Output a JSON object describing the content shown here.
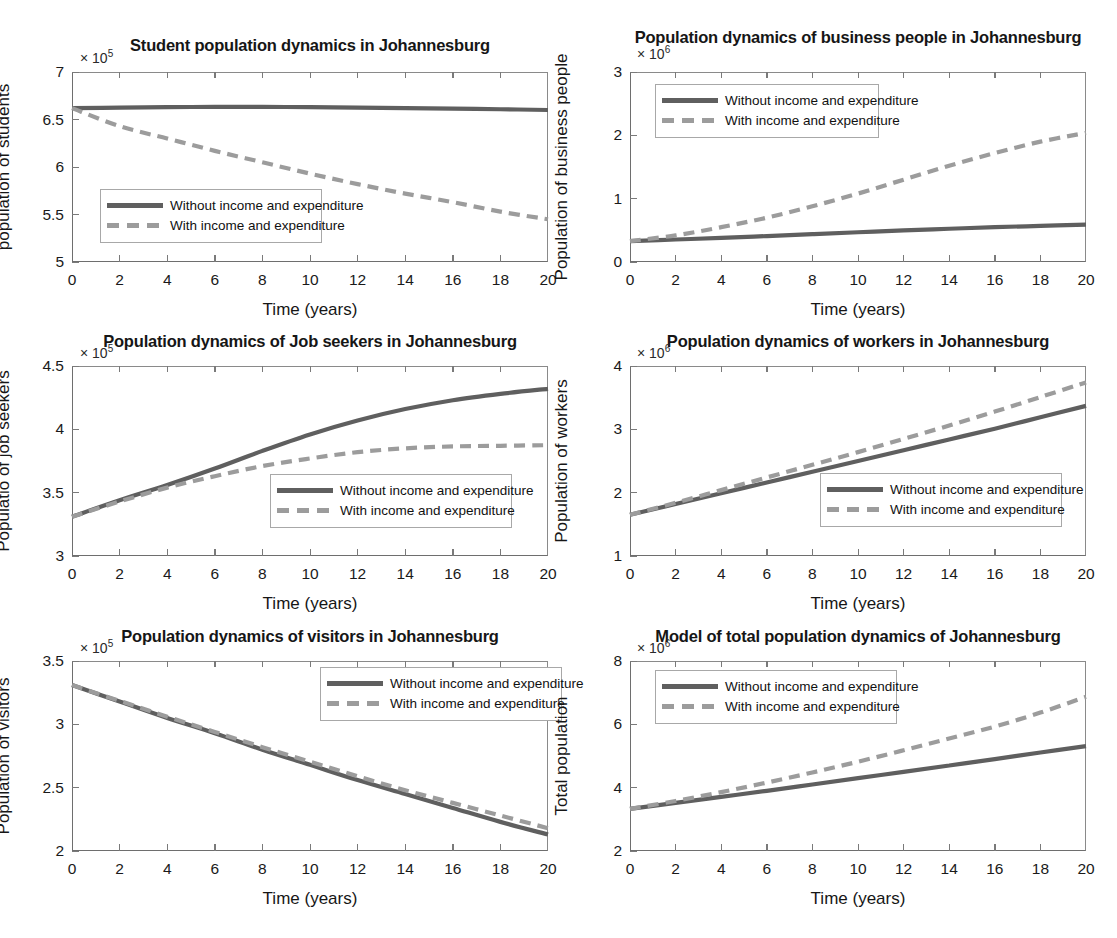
{
  "figure": {
    "layout": "3 rows x 2 columns of MATLAB line plots",
    "background": "#ffffff",
    "series_colors": {
      "without": "#5f5f5f",
      "with": "#9c9c9c"
    }
  },
  "legend_labels": {
    "without": "Without income and expenditure",
    "with": "With income and expenditure"
  },
  "xlabel": "Time (years)",
  "xticks": [
    "0",
    "2",
    "4",
    "6",
    "8",
    "10",
    "12",
    "14",
    "16",
    "18",
    "20"
  ],
  "chart_data": [
    {
      "id": "students",
      "type": "line",
      "title": "Student population dynamics in Johannesburg",
      "xlabel": "Time (years)",
      "ylabel": "population of students",
      "exponent_prefix": "× 10",
      "exponent": "5",
      "xlim": [
        0,
        20
      ],
      "ylim": [
        5,
        7
      ],
      "yticks": [
        "5",
        "5.5",
        "6",
        "6.5",
        "7"
      ],
      "xticks": [
        "0",
        "2",
        "4",
        "6",
        "8",
        "10",
        "12",
        "14",
        "16",
        "18",
        "20"
      ],
      "grid": false,
      "legend_position": "lower-left",
      "x": [
        0,
        2,
        4,
        6,
        8,
        10,
        12,
        14,
        16,
        18,
        20
      ],
      "series": [
        {
          "name": "Without income and expenditure",
          "style": "solid",
          "values": [
            6.62,
            6.625,
            6.63,
            6.632,
            6.632,
            6.63,
            6.625,
            6.62,
            6.615,
            6.608,
            6.6
          ]
        },
        {
          "name": "With income and expenditure",
          "style": "dashed",
          "values": [
            6.62,
            6.43,
            6.3,
            6.17,
            6.05,
            5.93,
            5.82,
            5.72,
            5.63,
            5.53,
            5.45
          ]
        }
      ]
    },
    {
      "id": "business-people",
      "type": "line",
      "title": "Population dynamics of business people in Johannesburg",
      "xlabel": "Time (years)",
      "ylabel": "Population of business people",
      "exponent_prefix": "× 10",
      "exponent": "6",
      "xlim": [
        0,
        20
      ],
      "ylim": [
        0,
        3
      ],
      "yticks": [
        "0",
        "1",
        "2",
        "3"
      ],
      "xticks": [
        "0",
        "2",
        "4",
        "6",
        "8",
        "10",
        "12",
        "14",
        "16",
        "18",
        "20"
      ],
      "grid": false,
      "legend_position": "upper-left",
      "x": [
        0,
        2,
        4,
        6,
        8,
        10,
        12,
        14,
        16,
        18,
        20
      ],
      "series": [
        {
          "name": "Without income and expenditure",
          "style": "solid",
          "values": [
            0.33,
            0.355,
            0.38,
            0.41,
            0.44,
            0.47,
            0.5,
            0.525,
            0.55,
            0.57,
            0.59
          ]
        },
        {
          "name": "With income and expenditure",
          "style": "dashed",
          "values": [
            0.33,
            0.42,
            0.55,
            0.7,
            0.88,
            1.08,
            1.3,
            1.52,
            1.72,
            1.9,
            2.04
          ]
        }
      ]
    },
    {
      "id": "job-seekers",
      "type": "line",
      "title": "Population dynamics of Job seekers in Johannesburg",
      "xlabel": "Time (years)",
      "ylabel": "Populatio of job seekers",
      "exponent_prefix": "× 10",
      "exponent": "5",
      "xlim": [
        0,
        20
      ],
      "ylim": [
        3,
        4.5
      ],
      "yticks": [
        "3",
        "3.5",
        "4",
        "4.5"
      ],
      "xticks": [
        "0",
        "2",
        "4",
        "6",
        "8",
        "10",
        "12",
        "14",
        "16",
        "18",
        "20"
      ],
      "grid": false,
      "legend_position": "lower-right",
      "x": [
        0,
        2,
        4,
        6,
        8,
        10,
        12,
        14,
        16,
        18,
        20
      ],
      "series": [
        {
          "name": "Without income and expenditure",
          "style": "solid",
          "values": [
            3.31,
            3.44,
            3.56,
            3.69,
            3.83,
            3.96,
            4.07,
            4.16,
            4.23,
            4.28,
            4.32
          ]
        },
        {
          "name": "With income and expenditure",
          "style": "dashed",
          "values": [
            3.31,
            3.43,
            3.54,
            3.63,
            3.71,
            3.77,
            3.82,
            3.85,
            3.865,
            3.87,
            3.875
          ]
        }
      ]
    },
    {
      "id": "workers",
      "type": "line",
      "title": "Population dynamics of workers in Johannesburg",
      "xlabel": "Time (years)",
      "ylabel": "Population of workers",
      "exponent_prefix": "× 10",
      "exponent": "6",
      "xlim": [
        0,
        20
      ],
      "ylim": [
        1,
        4
      ],
      "yticks": [
        "1",
        "2",
        "3",
        "4"
      ],
      "xticks": [
        "0",
        "2",
        "4",
        "6",
        "8",
        "10",
        "12",
        "14",
        "16",
        "18",
        "20"
      ],
      "grid": false,
      "legend_position": "lower-right",
      "x": [
        0,
        2,
        4,
        6,
        8,
        10,
        12,
        14,
        16,
        18,
        20
      ],
      "series": [
        {
          "name": "Without income and expenditure",
          "style": "solid",
          "values": [
            1.65,
            1.82,
            1.99,
            2.16,
            2.33,
            2.5,
            2.67,
            2.84,
            3.01,
            3.19,
            3.37
          ]
        },
        {
          "name": "With income and expenditure",
          "style": "dashed",
          "values": [
            1.65,
            1.84,
            2.04,
            2.24,
            2.44,
            2.64,
            2.85,
            3.06,
            3.28,
            3.51,
            3.74
          ]
        }
      ]
    },
    {
      "id": "visitors",
      "type": "line",
      "title": "Population dynamics of visitors in Johannesburg",
      "xlabel": "Time (years)",
      "ylabel": "Population of visitors",
      "exponent_prefix": "× 10",
      "exponent": "5",
      "xlim": [
        0,
        20
      ],
      "ylim": [
        2,
        3.5
      ],
      "yticks": [
        "2",
        "2.5",
        "3",
        "3.5"
      ],
      "xticks": [
        "0",
        "2",
        "4",
        "6",
        "8",
        "10",
        "12",
        "14",
        "16",
        "18",
        "20"
      ],
      "grid": false,
      "legend_position": "upper-right",
      "x": [
        0,
        2,
        4,
        6,
        8,
        10,
        12,
        14,
        16,
        18,
        20
      ],
      "series": [
        {
          "name": "Without income and expenditure",
          "style": "solid",
          "values": [
            3.31,
            3.18,
            3.05,
            2.93,
            2.8,
            2.68,
            2.56,
            2.45,
            2.34,
            2.23,
            2.13
          ]
        },
        {
          "name": "With income and expenditure",
          "style": "dashed",
          "values": [
            3.31,
            3.185,
            3.06,
            2.94,
            2.82,
            2.705,
            2.59,
            2.48,
            2.38,
            2.28,
            2.18
          ]
        }
      ]
    },
    {
      "id": "total-population",
      "type": "line",
      "title": "Model of total population dynamics of Johannesburg",
      "xlabel": "Time (years)",
      "ylabel": "Total population",
      "exponent_prefix": "× 10",
      "exponent": "6",
      "xlim": [
        0,
        20
      ],
      "ylim": [
        2,
        8
      ],
      "yticks": [
        "2",
        "4",
        "6",
        "8"
      ],
      "xticks": [
        "0",
        "2",
        "4",
        "6",
        "8",
        "10",
        "12",
        "14",
        "16",
        "18",
        "20"
      ],
      "grid": false,
      "legend_position": "upper-left",
      "x": [
        0,
        2,
        4,
        6,
        8,
        10,
        12,
        14,
        16,
        18,
        20
      ],
      "series": [
        {
          "name": "Without income and expenditure",
          "style": "solid",
          "values": [
            3.33,
            3.52,
            3.71,
            3.9,
            4.1,
            4.3,
            4.5,
            4.7,
            4.9,
            5.11,
            5.31
          ]
        },
        {
          "name": "With income and expenditure",
          "style": "dashed",
          "values": [
            3.33,
            3.58,
            3.86,
            4.16,
            4.48,
            4.82,
            5.18,
            5.55,
            5.93,
            6.37,
            6.87
          ]
        }
      ]
    }
  ]
}
